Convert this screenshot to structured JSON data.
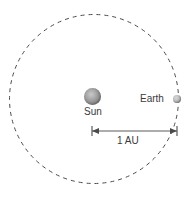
{
  "diagram": {
    "background_color": "#ffffff",
    "width": 191,
    "height": 200,
    "orbit": {
      "name": "earth-orbit",
      "shape": "circle",
      "style": "dashed",
      "stroke_color": "#4a4a4a",
      "center_x": 94,
      "center_y": 99,
      "radius": 84.5,
      "dash_pattern": "4 4",
      "stroke_width": 1
    },
    "bodies": [
      {
        "id": "sun",
        "label": "Sun",
        "center_x": 92.5,
        "center_y": 96.5,
        "diameter": 17,
        "fill_color": "#9a9a9a",
        "highlight_color": "#c9c9c9",
        "label_position": "below"
      },
      {
        "id": "earth",
        "label": "Earth",
        "center_x": 177,
        "center_y": 99,
        "diameter": 8,
        "fill_color": "#b0b0b0",
        "highlight_color": "#d8d8d8",
        "label_position": "left"
      }
    ],
    "measurement": {
      "id": "au-distance",
      "label": "1 AU",
      "value": 1,
      "unit": "AU",
      "from_x": 92,
      "to_x": 177,
      "line_y": 131,
      "tick_half_height": 5,
      "arrow_style": "double-headed",
      "stroke_color": "#5a5a5a",
      "label_x": 131,
      "label_y": 141
    },
    "text_color": "#3b3b3b"
  }
}
